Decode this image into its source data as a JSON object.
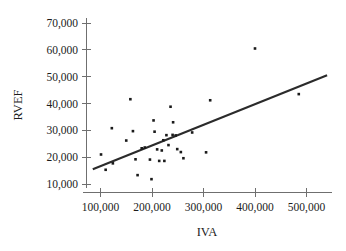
{
  "chart_data": {
    "type": "scatter",
    "title": "",
    "xlabel": "IVA",
    "ylabel": "RVEF",
    "xlim": [
      65000,
      545000
    ],
    "ylim": [
      7000,
      73000
    ],
    "grid": false,
    "legend": null,
    "xticks": [
      100000,
      200000,
      300000,
      400000,
      500000
    ],
    "xtick_labels": [
      "100,000",
      "200,000",
      "300,000",
      "400,000",
      "500,000"
    ],
    "yticks": [
      10000,
      20000,
      30000,
      40000,
      50000,
      60000,
      70000
    ],
    "ytick_labels": [
      "10,000",
      "20,000",
      "30,000",
      "40,000",
      "50,000",
      "60,000",
      "70,000"
    ],
    "series": [
      {
        "name": "observations",
        "marker": "square",
        "marker_color": "#1a1a1a",
        "points": [
          [
            101000,
            21000
          ],
          [
            110000,
            15300
          ],
          [
            122000,
            30800
          ],
          [
            124000,
            17700
          ],
          [
            150000,
            26200
          ],
          [
            158000,
            41600
          ],
          [
            163000,
            29700
          ],
          [
            168000,
            19200
          ],
          [
            172000,
            13300
          ],
          [
            180000,
            23300
          ],
          [
            186000,
            23600
          ],
          [
            196000,
            19100
          ],
          [
            199000,
            11800
          ],
          [
            203000,
            33700
          ],
          [
            205000,
            29500
          ],
          [
            210000,
            22900
          ],
          [
            214000,
            18600
          ],
          [
            219000,
            22500
          ],
          [
            222000,
            26300
          ],
          [
            224000,
            18600
          ],
          [
            228000,
            28200
          ],
          [
            232000,
            24500
          ],
          [
            236000,
            38800
          ],
          [
            240000,
            28300
          ],
          [
            241000,
            33000
          ],
          [
            246000,
            28100
          ],
          [
            249000,
            23000
          ],
          [
            256000,
            21900
          ],
          [
            261000,
            19600
          ],
          [
            278000,
            29200
          ],
          [
            305000,
            21800
          ],
          [
            313000,
            41200
          ],
          [
            400000,
            60500
          ],
          [
            485000,
            43500
          ]
        ]
      }
    ],
    "trendline": {
      "name": "regression-line",
      "color": "#2b2b2b",
      "x_start": 85000,
      "y_start": 15500,
      "x_end": 540000,
      "y_end": 50500
    }
  },
  "axes": {
    "y_axis_name": "RVEF",
    "x_axis_name": "IVA"
  }
}
